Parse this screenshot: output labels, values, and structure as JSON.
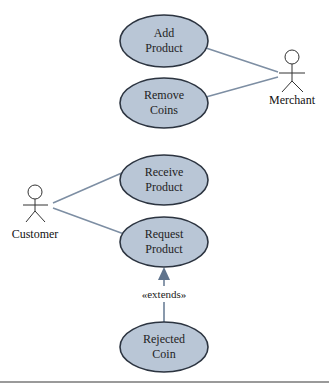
{
  "diagram": {
    "type": "uml-use-case",
    "colors": {
      "usecase_fill": "#b9c6d6",
      "usecase_stroke": "#2c3440",
      "association_line": "#7d8ea3",
      "actor_stroke": "#333333",
      "bottom_rule": "#9a9a9a"
    },
    "actors": [
      {
        "id": "merchant",
        "label": "Merchant"
      },
      {
        "id": "customer",
        "label": "Customer"
      }
    ],
    "use_cases": [
      {
        "id": "add_product",
        "line1": "Add",
        "line2": "Product"
      },
      {
        "id": "remove_coins",
        "line1": "Remove",
        "line2": "Coins"
      },
      {
        "id": "receive_product",
        "line1": "Receive",
        "line2": "Product"
      },
      {
        "id": "request_product",
        "line1": "Request",
        "line2": "Product"
      },
      {
        "id": "rejected_coin",
        "line1": "Rejected",
        "line2": "Coin"
      }
    ],
    "relationships": [
      {
        "from": "merchant",
        "to": "add_product",
        "type": "association"
      },
      {
        "from": "merchant",
        "to": "remove_coins",
        "type": "association"
      },
      {
        "from": "customer",
        "to": "receive_product",
        "type": "association"
      },
      {
        "from": "customer",
        "to": "request_product",
        "type": "association"
      },
      {
        "from": "rejected_coin",
        "to": "request_product",
        "type": "extends",
        "label": "«extends»"
      }
    ]
  }
}
